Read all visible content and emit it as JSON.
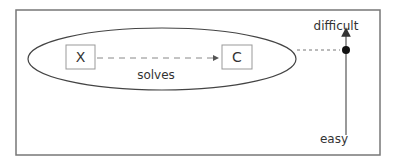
{
  "diagram": {
    "nodes": {
      "x": {
        "label": "X"
      },
      "c": {
        "label": "C"
      }
    },
    "edge": {
      "label": "solves",
      "from": "X",
      "to": "C",
      "style": "dashed"
    },
    "axis": {
      "top_label": "difficult",
      "bottom_label": "easy"
    },
    "colors": {
      "stroke": "#555555",
      "box_stroke": "#999999",
      "text": "#333333",
      "background": "#ffffff"
    }
  }
}
